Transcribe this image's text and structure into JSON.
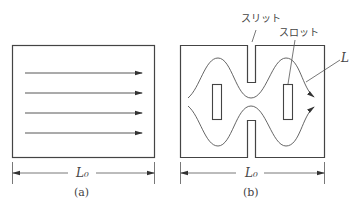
{
  "figure": {
    "panel_a": {
      "caption": "(a)",
      "dimension_label": "L₀",
      "description": "rectangle with four parallel straight field lines"
    },
    "panel_b": {
      "caption": "(b)",
      "dimension_label": "L₀",
      "labels": {
        "slit": "スリット",
        "slot": "スロット",
        "path": "L"
      },
      "description": "rectangle with top/bottom slits and two slots, causing curved field paths"
    }
  }
}
